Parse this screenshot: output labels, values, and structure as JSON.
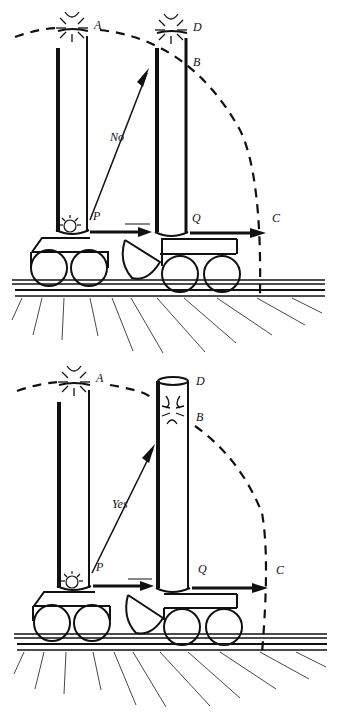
{
  "diagram": {
    "type": "physics-thought-experiment",
    "colors": {
      "ink": "#111111",
      "background": "#ffffff"
    },
    "panels": [
      {
        "id": "top",
        "arrow_label": "No",
        "points": {
          "A": "A",
          "D": "D",
          "B": "B",
          "P": "P",
          "Q": "Q",
          "C": "C"
        },
        "flash_at": [
          "A",
          "D"
        ],
        "description": "Light emitted at P travels to A; tube moved to Q; diagonal path marked No"
      },
      {
        "id": "bottom",
        "arrow_label": "Yes",
        "points": {
          "A": "A",
          "D": "D",
          "B": "B",
          "P": "P",
          "Q": "Q",
          "C": "C"
        },
        "flash_at": [
          "A",
          "B"
        ],
        "description": "Light emitted at P; moving tube catches light at B; diagonal path marked Yes"
      }
    ]
  }
}
